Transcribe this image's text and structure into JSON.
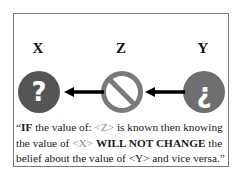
{
  "diagram": {
    "labels": {
      "x": "X",
      "z": "Z",
      "y": "Y"
    },
    "nodes": {
      "x": {
        "glyph": "?",
        "icon": "question-circle-icon",
        "fill": "#555555"
      },
      "z": {
        "icon": "prohibited-circle-icon",
        "stroke": "#7a7a7a"
      },
      "y": {
        "glyph": "¿",
        "icon": "inverted-question-circle-icon",
        "fill": "#6e6e6e"
      }
    },
    "edges": [
      {
        "from": "Z",
        "to": "X"
      },
      {
        "from": "Y",
        "to": "Z"
      }
    ]
  },
  "caption": {
    "open_quote": "“",
    "part1_bold": "IF",
    "part2": " the value of: ",
    "z_token": "<Z>",
    "part3": " is known then knowing the value of ",
    "x_token": "<X>",
    "part4": " ",
    "part5_bold": "WILL NOT CHANGE",
    "part6": " the belief about the value of ",
    "y_token": "<Y>",
    "part7": " and vice versa.",
    "close_quote": "”"
  }
}
